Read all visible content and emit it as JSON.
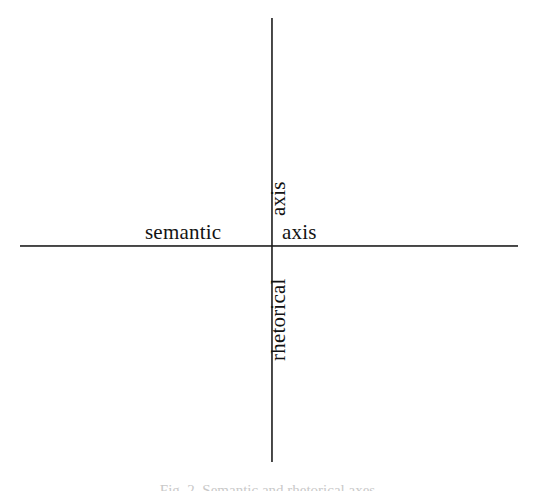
{
  "figure": {
    "type": "cartesian-axes-diagram",
    "background_color": "#ffffff",
    "line_color": "#1a1a1a",
    "text_color": "#131313",
    "labels": {
      "left": "semantic",
      "right": "axis",
      "top": "axis",
      "bottom": "rhetorical"
    },
    "caption": "Fig. 2. Semantic and rhetorical axes"
  },
  "chart_data": {
    "type": "scatter",
    "title": "",
    "subtitle": "",
    "xlabel": "semantic axis",
    "ylabel": "rhetorical axis",
    "x": [],
    "y": [],
    "series": [],
    "annotations": [
      {
        "text": "semantic",
        "position": "left-of-origin",
        "rotation": 0
      },
      {
        "text": "axis",
        "position": "right-of-origin",
        "rotation": 0
      },
      {
        "text": "axis",
        "position": "above-origin",
        "rotation": -90
      },
      {
        "text": "rhetorical",
        "position": "below-origin",
        "rotation": -90
      }
    ],
    "axes": {
      "horizontal": {
        "label": "semantic axis",
        "ticks": [],
        "tick_labels": [],
        "arrowheads": false
      },
      "vertical": {
        "label": "rhetorical axis",
        "ticks": [],
        "tick_labels": [],
        "arrowheads": false
      }
    },
    "grid": false,
    "legend": null,
    "origin_marked": false
  }
}
